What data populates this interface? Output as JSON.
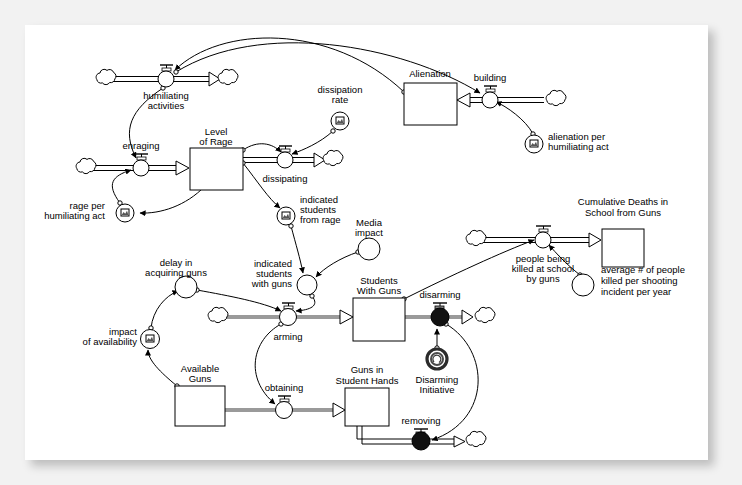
{
  "page": {
    "background_color": "#f2f2f2",
    "canvas_color": "#ffffff",
    "line_color": "#000000",
    "flow_color": "#808080"
  },
  "stocks": [
    {
      "id": "level_of_rage",
      "label": "Level\nof Rage",
      "label_line1": "Level",
      "label_line2": "of Rage",
      "x": 190,
      "y": 148,
      "w": 53,
      "h": 42
    },
    {
      "id": "alienation",
      "label": "Alienation",
      "label_line1": "Alienation",
      "label_line2": "",
      "x": 404,
      "y": 83,
      "w": 53,
      "h": 42
    },
    {
      "id": "cumulative_deaths",
      "label": "Cumulative Deaths in School from Guns",
      "label_line1": "Cumulative Deaths in",
      "label_line2": "School from Guns",
      "x": 602,
      "y": 229,
      "w": 42,
      "h": 38
    },
    {
      "id": "students_with_guns",
      "label": "Students With Guns",
      "label_line1": "Students",
      "label_line2": "With Guns",
      "x": 353,
      "y": 298,
      "w": 52,
      "h": 43
    },
    {
      "id": "available_guns",
      "label": "Available Guns",
      "label_line1": "Available",
      "label_line2": "Guns",
      "x": 175,
      "y": 386,
      "w": 50,
      "h": 40
    },
    {
      "id": "guns_in_student_hands",
      "label": "Guns in Student Hands",
      "label_line1": "Guns in",
      "label_line2": "Student Hands",
      "x": 345,
      "y": 388,
      "w": 44,
      "h": 38
    }
  ],
  "flows": [
    {
      "id": "humiliating_activities",
      "label": "humiliating activities",
      "label_line1": "humiliating",
      "label_line2": "activities",
      "cx": 166,
      "cy": 79,
      "style": "open"
    },
    {
      "id": "enraging",
      "label": "enraging",
      "label_line1": "enraging",
      "label_line2": "",
      "cx": 141,
      "cy": 168,
      "style": "open"
    },
    {
      "id": "dissipating",
      "label": "dissipating",
      "label_line1": "dissipating",
      "label_line2": "",
      "cx": 285,
      "cy": 160,
      "style": "open"
    },
    {
      "id": "building",
      "label": "building",
      "label_line1": "building",
      "label_line2": "",
      "cx": 490,
      "cy": 100,
      "style": "open"
    },
    {
      "id": "people_being_killed",
      "label": "people being killed at school by guns",
      "label_line1": "people being",
      "label_line2": "killed at school",
      "label_line3": "by guns",
      "cx": 543,
      "cy": 240,
      "style": "open"
    },
    {
      "id": "arming",
      "label": "arming",
      "label_line1": "arming",
      "label_line2": "",
      "cx": 288,
      "cy": 317,
      "style": "open"
    },
    {
      "id": "disarming",
      "label": "disarming",
      "label_line1": "disarming",
      "label_line2": "",
      "cx": 440,
      "cy": 317,
      "style": "filled"
    },
    {
      "id": "obtaining",
      "label": "obtaining",
      "label_line1": "obtaining",
      "label_line2": "",
      "cx": 284,
      "cy": 410,
      "style": "open"
    },
    {
      "id": "removing",
      "label": "removing",
      "label_line1": "removing",
      "label_line2": "",
      "cx": 421,
      "cy": 441,
      "style": "filled"
    }
  ],
  "auxiliaries": [
    {
      "id": "dissipation_rate",
      "label": "dissipation rate",
      "label_line1": "dissipation",
      "label_line2": "rate",
      "cx": 340,
      "cy": 121,
      "type": "lookup"
    },
    {
      "id": "rage_per_humiliating_act",
      "label": "rage per humiliating act",
      "label_line1": "rage per",
      "label_line2": "humiliating act",
      "cx": 125,
      "cy": 213,
      "type": "lookup"
    },
    {
      "id": "alienation_per_humiliating_act",
      "label": "alienation per humiliating act",
      "label_line1": "alienation per",
      "label_line2": "humiliating act",
      "cx": 534,
      "cy": 144,
      "type": "lookup"
    },
    {
      "id": "indicated_students_from_rage",
      "label": "indicated students from rage",
      "label_line1": "indicated",
      "label_line2": "students",
      "label_line3": "from rage",
      "cx": 286,
      "cy": 216,
      "type": "lookup"
    },
    {
      "id": "indicated_students_with_guns",
      "label": "indicated students with guns",
      "label_line1": "indicated",
      "label_line2": "students",
      "label_line3": "with guns",
      "cx": 307,
      "cy": 285,
      "type": "plain"
    },
    {
      "id": "media_impact",
      "label": "Media impact",
      "label_line1": "Media",
      "label_line2": "impact",
      "cx": 369,
      "cy": 249,
      "type": "plain"
    },
    {
      "id": "delay_in_acquiring_guns",
      "label": "delay in acquiring guns",
      "label_line1": "delay in",
      "label_line2": "acquiring guns",
      "cx": 186,
      "cy": 287,
      "type": "plain"
    },
    {
      "id": "impact_of_availability",
      "label": "impact of availability",
      "label_line1": "impact",
      "label_line2": "of availability",
      "cx": 150,
      "cy": 339,
      "type": "lookup"
    },
    {
      "id": "average_killed_per_incident",
      "label": "average # of people killed per shooting incident per year",
      "label_line1": "average # of people",
      "label_line2": "killed per shooting",
      "label_line3": "incident per year",
      "cx": 583,
      "cy": 285,
      "type": "plain"
    },
    {
      "id": "disarming_initiative",
      "label": "Disarming Initiative",
      "label_line1": "Disarming",
      "label_line2": "Initiative",
      "cx": 437,
      "cy": 359,
      "type": "shadow"
    }
  ],
  "clouds": [
    {
      "id": "cloud-humiliating-source",
      "cx": 104,
      "cy": 79
    },
    {
      "id": "cloud-humiliating-sink",
      "cx": 226,
      "cy": 79
    },
    {
      "id": "cloud-enraging-source",
      "cx": 84,
      "cy": 168
    },
    {
      "id": "cloud-dissipating-sink",
      "cx": 331,
      "cy": 160
    },
    {
      "id": "cloud-building-source",
      "cx": 554,
      "cy": 100
    },
    {
      "id": "cloud-killed-source",
      "cx": 474,
      "cy": 240
    },
    {
      "id": "cloud-arming-source",
      "cx": 216,
      "cy": 317
    },
    {
      "id": "cloud-disarming-sink",
      "cx": 477,
      "cy": 317
    },
    {
      "id": "cloud-removing-sink",
      "cx": 467,
      "cy": 441
    }
  ],
  "diagram_meta": {
    "type": "system-dynamics-stock-and-flow",
    "stock_count": 6,
    "flow_count": 9,
    "auxiliary_count": 10,
    "cloud_count": 9
  }
}
